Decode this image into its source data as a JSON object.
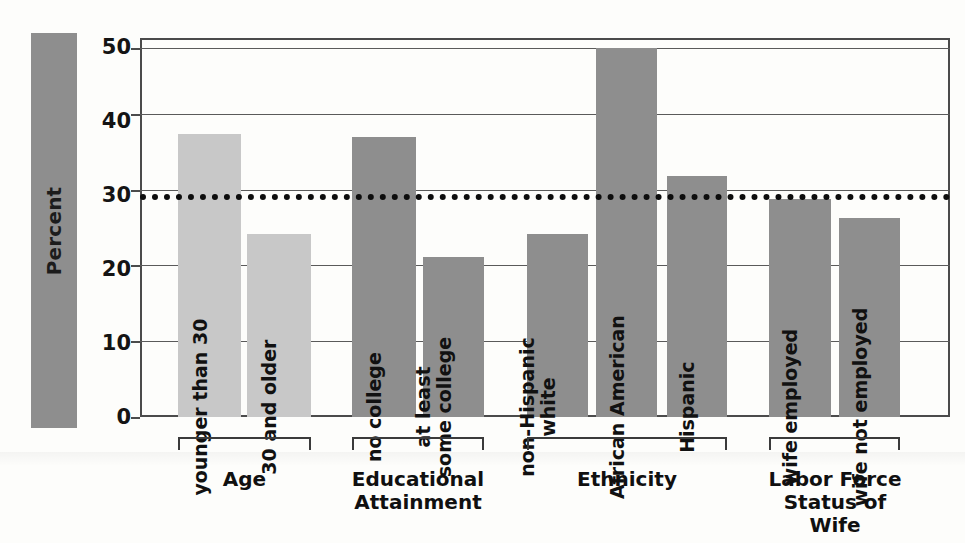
{
  "chart_data": {
    "type": "bar",
    "title": "",
    "xlabel": "",
    "ylabel": "Percent",
    "ylim": [
      0,
      50
    ],
    "yticks": [
      0,
      10,
      20,
      30,
      40,
      50
    ],
    "ytick_labels": [
      "0",
      "10",
      "20",
      "30",
      "40",
      "50"
    ],
    "grid": true,
    "legend": "none",
    "reference_line": {
      "value": 29.4,
      "style": "dotted",
      "color": "#0d0d0d"
    },
    "groups": [
      {
        "name": "Age",
        "caption": "Age",
        "color": "#c8c8c8",
        "categories": [
          "younger than 30",
          "30 and older"
        ],
        "values": [
          37.3,
          24.2
        ]
      },
      {
        "name": "Educational Attainment",
        "caption": "Educational\nAttainment",
        "color": "#8e8e8e",
        "categories": [
          "no college",
          "at least\nsome college"
        ],
        "values": [
          36.9,
          21.1
        ]
      },
      {
        "name": "Ethnicity",
        "caption": "Ethnicity",
        "color": "#8e8e8e",
        "categories": [
          "non-Hispanic\nwhite",
          "African American",
          "Hispanic"
        ],
        "values": [
          24.2,
          48.7,
          31.8
        ]
      },
      {
        "name": "Labor Force Status of Wife",
        "caption": "Labor Force\nStatus of Wife",
        "color": "#8e8e8e",
        "categories": [
          "wife employed",
          "wife not employed"
        ],
        "values": [
          28.8,
          26.3
        ]
      }
    ],
    "categories": [
      "younger than 30",
      "30 and older",
      "no college",
      "at least some college",
      "non-Hispanic white",
      "African American",
      "Hispanic",
      "wife employed",
      "wife not employed"
    ],
    "values": [
      37.3,
      24.2,
      36.9,
      21.1,
      24.2,
      48.7,
      31.8,
      28.8,
      26.3
    ]
  },
  "axis": {
    "y_label": "Percent",
    "ticks": [
      "50",
      "40",
      "30",
      "20",
      "10",
      "0"
    ]
  },
  "bars": [
    {
      "label": "younger than 30",
      "value": 37.3,
      "color": "#c8c8c8"
    },
    {
      "label": "30 and older",
      "value": 24.2,
      "color": "#c8c8c8"
    },
    {
      "label": "no college",
      "value": 36.9,
      "color": "#8e8e8e"
    },
    {
      "label": "at least\nsome college",
      "value": 21.1,
      "color": "#8e8e8e"
    },
    {
      "label": "non-Hispanic\nwhite",
      "value": 24.2,
      "color": "#8e8e8e"
    },
    {
      "label": "African American",
      "value": 48.7,
      "color": "#8e8e8e"
    },
    {
      "label": "Hispanic",
      "value": 31.8,
      "color": "#8e8e8e"
    },
    {
      "label": "wife employed",
      "value": 28.8,
      "color": "#8e8e8e"
    },
    {
      "label": "wife not employed",
      "value": 26.3,
      "color": "#8e8e8e"
    }
  ],
  "group_captions": [
    "Age",
    "Educational\nAttainment",
    "Ethnicity",
    "Labor Force\nStatus of Wife"
  ],
  "colors": {
    "bar_light": "#c8c8c8",
    "bar_dark": "#8e8e8e",
    "axis_line": "#4b4b4b",
    "grid_line": "#5a5a5a",
    "reference_line": "#0d0d0d",
    "text": "#111111",
    "background": "#fdfdfb"
  }
}
